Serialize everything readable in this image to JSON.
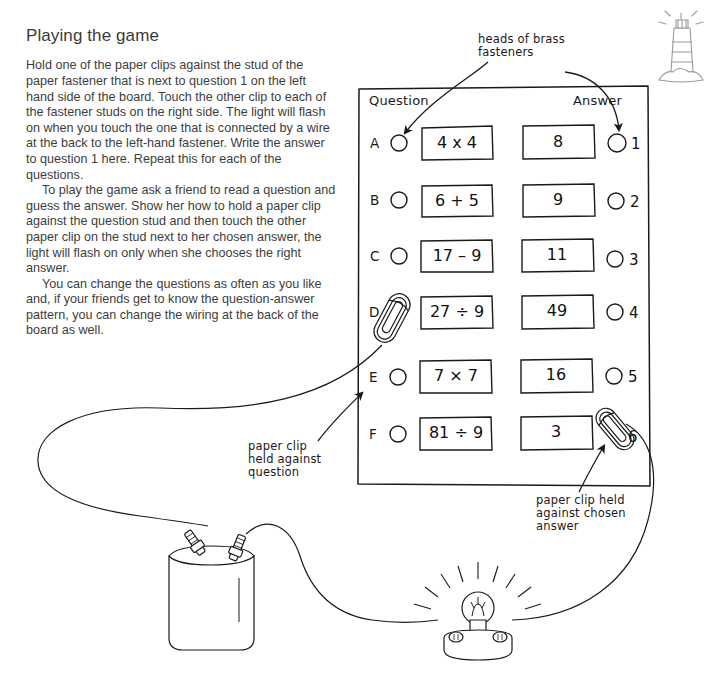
{
  "page": {
    "title": "Playing the game",
    "paragraphs": [
      "Hold one of the paper clips against the stud of the paper fastener that is next to question 1 on the left hand side of the board. Touch the other clip to each of the fastener studs on the right side. The light will flash on when you touch the one that is connected by a wire at the back to the left-hand fastener. Write the answer to question 1 here. Repeat this for each of the questions.",
      "To play the game ask a friend to read a question and guess the answer. Show her how to hold a paper clip against the question stud and then touch the other paper clip on the stud next to her chosen answer, the light will flash on only when she chooses the right answer.",
      "You can change the questions as often as you like and, if your friends get to know the question-answer pattern, you can change the wiring at the back of the board as well."
    ]
  },
  "logo": {
    "name": "lighthouse-logo",
    "color": "#9a9a9a"
  },
  "board": {
    "question_header": "Question",
    "answer_header": "Answer",
    "rows": [
      {
        "letter": "A",
        "question": "4 x 4",
        "answer": "8",
        "number": "1"
      },
      {
        "letter": "B",
        "question": "6 + 5",
        "answer": "9",
        "number": "2"
      },
      {
        "letter": "C",
        "question": "17 – 9",
        "answer": "11",
        "number": "3"
      },
      {
        "letter": "D",
        "question": "27 ÷ 9",
        "answer": "49",
        "number": "4"
      },
      {
        "letter": "E",
        "question": "7 × 7",
        "answer": "16",
        "number": "5"
      },
      {
        "letter": "F",
        "question": "81 ÷ 9",
        "answer": "3",
        "number": "6"
      }
    ]
  },
  "annotations": {
    "fasteners": "heads of brass\nfasteners",
    "clip_question": "paper clip\nheld against\nquestion",
    "clip_answer": "paper clip held\nagainst chosen\nanswer"
  },
  "circuit": {
    "battery": "battery",
    "bulb": "light-bulb",
    "wire": "wire"
  },
  "colors": {
    "ink": "#1a1a1a",
    "text": "#3d3d3d",
    "paper": "#ffffff"
  }
}
